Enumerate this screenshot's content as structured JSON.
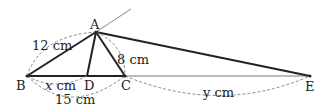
{
  "diagram": {
    "points": {
      "A": {
        "label": "A",
        "x": 96,
        "y": 32
      },
      "B": {
        "label": "B",
        "x": 27,
        "y": 76
      },
      "C": {
        "label": "C",
        "x": 125,
        "y": 76
      },
      "D": {
        "label": "D",
        "x": 87,
        "y": 76
      },
      "E": {
        "label": "E",
        "x": 310,
        "y": 76
      }
    },
    "measures": {
      "AB": "12 cm",
      "AC": "8 cm",
      "BC": "15 cm",
      "BD_var": "x",
      "BD_unit": " cm",
      "CE_var": "y",
      "CE_unit": " cm"
    },
    "colors": {
      "stroke": "#222222",
      "thin": "#777777",
      "dash": "#8a8a8a"
    }
  }
}
